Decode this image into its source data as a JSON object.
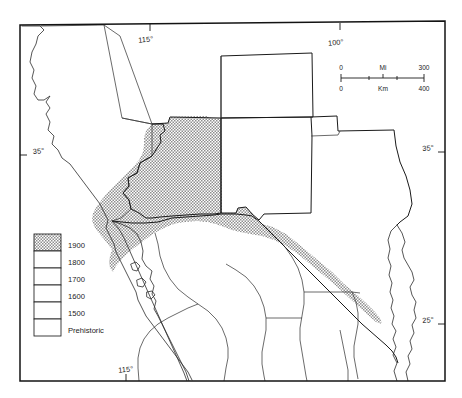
{
  "map": {
    "title": "",
    "graticule_labels": [
      {
        "id": "lon-115-top",
        "text": "115°",
        "x": 146,
        "y": 42,
        "rotate": -5
      },
      {
        "id": "lon-100-top",
        "text": "100°",
        "x": 336,
        "y": 46,
        "rotate": -5
      },
      {
        "id": "lat-35-left",
        "text": "35°",
        "x": 24,
        "y": 152,
        "rotate": -5
      },
      {
        "id": "lat-35-right",
        "text": "35°",
        "x": 428,
        "y": 150,
        "rotate": -5
      },
      {
        "id": "lat-25-right",
        "text": "25°",
        "x": 428,
        "y": 322,
        "rotate": -5
      },
      {
        "id": "lon-115-bottom",
        "text": "115°",
        "x": 122,
        "y": 375,
        "rotate": -5
      }
    ],
    "scalebar": {
      "name": "scale-bar",
      "top_unit": "Mi",
      "bottom_unit": "Km",
      "top_left_value": "0",
      "top_right_value": "300",
      "bottom_left_value": "0",
      "bottom_right_value": "400"
    },
    "legend": {
      "name": "date-legend",
      "entries": [
        {
          "label": "1900",
          "shaded": true
        },
        {
          "label": "1800",
          "shaded": false
        },
        {
          "label": "1700",
          "shaded": false
        },
        {
          "label": "1600",
          "shaded": false
        },
        {
          "label": "1500",
          "shaded": false
        },
        {
          "label": "Prehistoric",
          "shaded": false
        }
      ]
    },
    "colors": {
      "shade_fill": "#a8a8a8",
      "line": "#1a1a1a",
      "frame": "#131313",
      "background": "#ffffff"
    }
  }
}
